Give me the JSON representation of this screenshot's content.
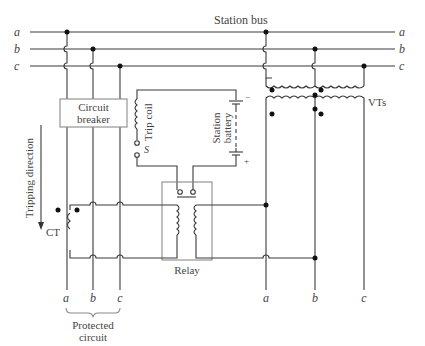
{
  "diagram": {
    "title": "Station bus",
    "bus_phases": [
      "a",
      "b",
      "c"
    ],
    "components": {
      "circuit_breaker": "Circuit breaker",
      "circuit_breaker_lines": [
        "Circuit",
        "breaker"
      ],
      "trip_coil": "Trip coil",
      "switch_label": "S",
      "station_battery": "Station battery",
      "station_battery_lines": [
        "Station",
        "battery"
      ],
      "battery_minus": "−",
      "battery_plus": "+",
      "relay": "Relay",
      "ct": "CT",
      "vts": "VTs"
    },
    "annotations": {
      "tripping_direction": "Tripping direction",
      "protected_circuit_lines": [
        "Protected",
        "circuit"
      ]
    },
    "bottom_labels": {
      "protected": [
        "a",
        "b",
        "c"
      ],
      "vt_side": [
        "a",
        "b",
        "c"
      ]
    },
    "colors": {
      "wire": "#3a3a3a",
      "box": "#8a8a8a",
      "junction": "#111111",
      "text": "#444444"
    }
  }
}
